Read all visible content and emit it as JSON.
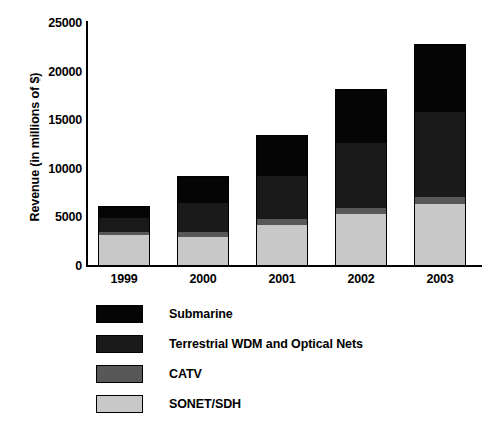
{
  "chart_data": {
    "type": "bar",
    "subtype": "stacked-bar",
    "title": "",
    "xlabel": "",
    "ylabel": "Revenue (in millions of $)",
    "categories": [
      "1999",
      "2000",
      "2001",
      "2002",
      "2003"
    ],
    "ylim": [
      0,
      25000
    ],
    "yticks": [
      0,
      5000,
      10000,
      15000,
      20000,
      25000
    ],
    "ytick_labels": [
      "0",
      "5000",
      "10000",
      "15000",
      "20000",
      "25000"
    ],
    "grid": false,
    "legend_position": "below-plot-left",
    "series": [
      {
        "name": "SONET/SDH",
        "color": "#c8c8c8",
        "values": [
          3150,
          2950,
          4200,
          5400,
          6400
        ]
      },
      {
        "name": "CATV",
        "color": "#585858",
        "values": [
          300,
          500,
          600,
          550,
          700
        ]
      },
      {
        "name": "Terrestrial WDM and Optical Nets",
        "color": "#1a1a1a",
        "values": [
          1500,
          3000,
          4500,
          6700,
          8700
        ]
      },
      {
        "name": "Submarine",
        "color": "#050505",
        "values": [
          1250,
          2850,
          4200,
          5550,
          7000
        ]
      }
    ],
    "totals": [
      6200,
      9300,
      13500,
      18200,
      22800
    ],
    "legend_order": [
      "Submarine",
      "Terrestrial WDM and Optical Nets",
      "CATV",
      "SONET/SDH"
    ]
  },
  "legend": {
    "items": [
      {
        "label": "Submarine",
        "color": "#050505"
      },
      {
        "label": "Terrestrial WDM and Optical Nets",
        "color": "#1a1a1a"
      },
      {
        "label": "CATV",
        "color": "#585858"
      },
      {
        "label": "SONET/SDH",
        "color": "#c8c8c8"
      }
    ]
  },
  "axes": {
    "y_title": "Revenue (in millions of $)"
  }
}
